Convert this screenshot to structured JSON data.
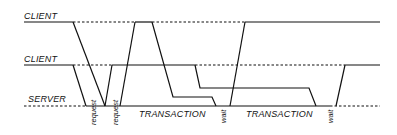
{
  "diagram": {
    "lanes": [
      {
        "id": "client-1",
        "label": "CLIENT",
        "y": 22
      },
      {
        "id": "client-2",
        "label": "CLIENT",
        "y": 65
      },
      {
        "id": "server",
        "label": "SERVER",
        "y": 106
      }
    ],
    "annotations": {
      "request_1": "request",
      "request_2": "request",
      "transaction_1": "TRANSACTION",
      "transaction_2": "TRANSACTION",
      "wait_1": "wait",
      "wait_2": "wait"
    },
    "colors": {
      "line": "#111111",
      "background": "#ffffff"
    }
  }
}
